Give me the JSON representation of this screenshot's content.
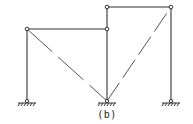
{
  "figure": {
    "caption": "(b)",
    "type": "structural frame diagram",
    "nodes": [
      {
        "id": "A",
        "x": 27,
        "y": 29,
        "kind": "hinge"
      },
      {
        "id": "B",
        "x": 107,
        "y": 29,
        "kind": "hinge"
      },
      {
        "id": "C",
        "x": 107,
        "y": 7,
        "kind": "hinge"
      },
      {
        "id": "D",
        "x": 171,
        "y": 7,
        "kind": "hinge"
      },
      {
        "id": "S1",
        "x": 27,
        "y": 101,
        "kind": "pinned-support"
      },
      {
        "id": "S2",
        "x": 107,
        "y": 101,
        "kind": "pinned-support"
      },
      {
        "id": "S3",
        "x": 171,
        "y": 101,
        "kind": "pinned-support"
      }
    ],
    "members": [
      {
        "from": "S1",
        "to": "A",
        "style": "solid"
      },
      {
        "from": "A",
        "to": "B",
        "style": "solid"
      },
      {
        "from": "S2",
        "to": "C",
        "style": "solid"
      },
      {
        "from": "C",
        "to": "D",
        "style": "solid"
      },
      {
        "from": "S3",
        "to": "D",
        "style": "solid"
      },
      {
        "from": "A",
        "to": "S2",
        "style": "dashed"
      },
      {
        "from": "S2",
        "to": "D",
        "style": "dashed"
      }
    ],
    "colors": {
      "line": "#333333",
      "diagonal": "#555555",
      "background": "#ffffff"
    }
  }
}
